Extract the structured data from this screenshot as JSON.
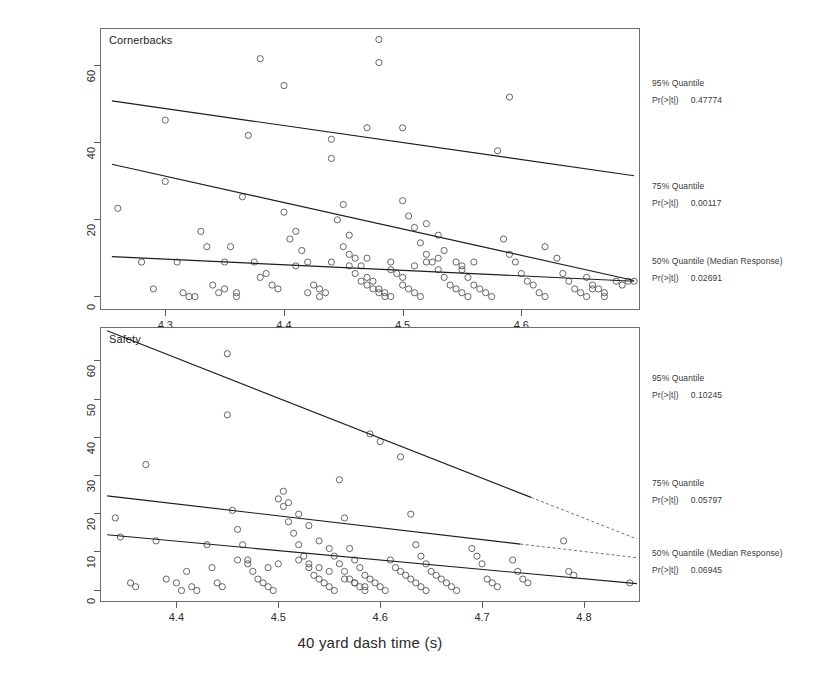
{
  "figure": {
    "xlabel": "40 yard dash time (s)",
    "ylabel": "Career Approximate Value"
  },
  "chart_data": [
    {
      "type": "scatter",
      "title": "Cornerbacks",
      "xlabel": "40 yard dash time (s)",
      "ylabel": "Career Approximate Value",
      "xlim": [
        4.245,
        4.7
      ],
      "ylim": [
        -3.5,
        70
      ],
      "xticks": [
        4.3,
        4.4,
        4.5,
        4.6
      ],
      "yticks": [
        0,
        20,
        40,
        60
      ],
      "grid": false,
      "points": [
        [
          4.26,
          23
        ],
        [
          4.28,
          9
        ],
        [
          4.29,
          2
        ],
        [
          4.3,
          30
        ],
        [
          4.3,
          46
        ],
        [
          4.31,
          9
        ],
        [
          4.315,
          1
        ],
        [
          4.32,
          0
        ],
        [
          4.325,
          0
        ],
        [
          4.33,
          17
        ],
        [
          4.335,
          13
        ],
        [
          4.34,
          3
        ],
        [
          4.345,
          1
        ],
        [
          4.35,
          9
        ],
        [
          4.355,
          13
        ],
        [
          4.36,
          0
        ],
        [
          4.365,
          26
        ],
        [
          4.37,
          42
        ],
        [
          4.375,
          9
        ],
        [
          4.38,
          5
        ],
        [
          4.385,
          6
        ],
        [
          4.39,
          3
        ],
        [
          4.395,
          2
        ],
        [
          4.4,
          55
        ],
        [
          4.4,
          22
        ],
        [
          4.405,
          15
        ],
        [
          4.41,
          17
        ],
        [
          4.415,
          12
        ],
        [
          4.42,
          9
        ],
        [
          4.425,
          3
        ],
        [
          4.43,
          2
        ],
        [
          4.435,
          1
        ],
        [
          4.44,
          41
        ],
        [
          4.445,
          20
        ],
        [
          4.45,
          13
        ],
        [
          4.455,
          11
        ],
        [
          4.46,
          6
        ],
        [
          4.465,
          4
        ],
        [
          4.47,
          3
        ],
        [
          4.475,
          2
        ],
        [
          4.48,
          1
        ],
        [
          4.485,
          0
        ],
        [
          4.49,
          7
        ],
        [
          4.495,
          6
        ],
        [
          4.5,
          5
        ],
        [
          4.5,
          3
        ],
        [
          4.505,
          2
        ],
        [
          4.51,
          1
        ],
        [
          4.515,
          0
        ],
        [
          4.44,
          36
        ],
        [
          4.45,
          24
        ],
        [
          4.455,
          16
        ],
        [
          4.46,
          10
        ],
        [
          4.465,
          8
        ],
        [
          4.47,
          5
        ],
        [
          4.475,
          4
        ],
        [
          4.48,
          2
        ],
        [
          4.485,
          1
        ],
        [
          4.49,
          0
        ],
        [
          4.5,
          25
        ],
        [
          4.505,
          21
        ],
        [
          4.51,
          18
        ],
        [
          4.515,
          14
        ],
        [
          4.52,
          11
        ],
        [
          4.525,
          9
        ],
        [
          4.53,
          7
        ],
        [
          4.535,
          5
        ],
        [
          4.54,
          3
        ],
        [
          4.545,
          2
        ],
        [
          4.55,
          1
        ],
        [
          4.555,
          0
        ],
        [
          4.48,
          67
        ],
        [
          4.48,
          61
        ],
        [
          4.47,
          44
        ],
        [
          4.5,
          44
        ],
        [
          4.52,
          19
        ],
        [
          4.53,
          16
        ],
        [
          4.535,
          12
        ],
        [
          4.545,
          9
        ],
        [
          4.55,
          7
        ],
        [
          4.555,
          5
        ],
        [
          4.56,
          3
        ],
        [
          4.565,
          2
        ],
        [
          4.57,
          1
        ],
        [
          4.575,
          0
        ],
        [
          4.58,
          38
        ],
        [
          4.585,
          15
        ],
        [
          4.59,
          11
        ],
        [
          4.595,
          9
        ],
        [
          4.6,
          6
        ],
        [
          4.605,
          4
        ],
        [
          4.61,
          3
        ],
        [
          4.615,
          1
        ],
        [
          4.62,
          0
        ],
        [
          4.59,
          52
        ],
        [
          4.62,
          13
        ],
        [
          4.63,
          10
        ],
        [
          4.635,
          6
        ],
        [
          4.64,
          4
        ],
        [
          4.645,
          2
        ],
        [
          4.65,
          1
        ],
        [
          4.655,
          0
        ],
        [
          4.66,
          3
        ],
        [
          4.665,
          2
        ],
        [
          4.67,
          1
        ],
        [
          4.68,
          4
        ],
        [
          4.685,
          3
        ],
        [
          4.69,
          4
        ],
        [
          4.695,
          4
        ],
        [
          4.655,
          5
        ],
        [
          4.66,
          2
        ],
        [
          4.67,
          0
        ],
        [
          4.38,
          62
        ],
        [
          4.42,
          1
        ],
        [
          4.43,
          0
        ],
        [
          4.35,
          2
        ],
        [
          4.36,
          1
        ],
        [
          4.41,
          8
        ],
        [
          4.44,
          9
        ],
        [
          4.455,
          8
        ],
        [
          4.47,
          10
        ],
        [
          4.49,
          9
        ],
        [
          4.51,
          8
        ],
        [
          4.52,
          9
        ],
        [
          4.53,
          10
        ],
        [
          4.55,
          8
        ],
        [
          4.56,
          9
        ]
      ],
      "fits": [
        {
          "name": "95% Quantile",
          "p_label": "Pr(>|t|)",
          "p_value": "0.47774",
          "x0": 4.255,
          "y0": 51.0,
          "x1": 4.695,
          "y1": 31.5,
          "solid_to": 1.0
        },
        {
          "name": "75% Quantile",
          "p_label": "Pr(>|t|)",
          "p_value": "0.00117",
          "x0": 4.255,
          "y0": 34.5,
          "x1": 4.695,
          "y1": 4.2,
          "solid_to": 1.0
        },
        {
          "name": "50% Quantile (Median Response)",
          "p_label": "Pr(>|t|)",
          "p_value": "0.02691",
          "x0": 4.255,
          "y0": 10.4,
          "x1": 4.695,
          "y1": 4.0,
          "solid_to": 1.0
        }
      ]
    },
    {
      "type": "scatter",
      "title": "Safety",
      "xlabel": "40 yard dash time (s)",
      "ylabel": "Career Approximate Value",
      "xlim": [
        4.325,
        4.855
      ],
      "ylim": [
        -3.0,
        69
      ],
      "xticks": [
        4.4,
        4.5,
        4.6,
        4.7,
        4.8
      ],
      "yticks": [
        0,
        10,
        20,
        30,
        40,
        50,
        60
      ],
      "grid": false,
      "points": [
        [
          4.34,
          19
        ],
        [
          4.345,
          14
        ],
        [
          4.355,
          2
        ],
        [
          4.36,
          1
        ],
        [
          4.37,
          33
        ],
        [
          4.38,
          13
        ],
        [
          4.39,
          3
        ],
        [
          4.4,
          2
        ],
        [
          4.405,
          0
        ],
        [
          4.41,
          5
        ],
        [
          4.415,
          1
        ],
        [
          4.42,
          0
        ],
        [
          4.43,
          12
        ],
        [
          4.435,
          6
        ],
        [
          4.44,
          2
        ],
        [
          4.445,
          1
        ],
        [
          4.45,
          62
        ],
        [
          4.45,
          46
        ],
        [
          4.455,
          21
        ],
        [
          4.46,
          16
        ],
        [
          4.465,
          12
        ],
        [
          4.47,
          8
        ],
        [
          4.475,
          5
        ],
        [
          4.48,
          3
        ],
        [
          4.485,
          2
        ],
        [
          4.49,
          1
        ],
        [
          4.495,
          0
        ],
        [
          4.5,
          24
        ],
        [
          4.505,
          22
        ],
        [
          4.51,
          18
        ],
        [
          4.515,
          15
        ],
        [
          4.52,
          12
        ],
        [
          4.525,
          9
        ],
        [
          4.53,
          6
        ],
        [
          4.535,
          4
        ],
        [
          4.54,
          3
        ],
        [
          4.545,
          2
        ],
        [
          4.55,
          1
        ],
        [
          4.555,
          0
        ],
        [
          4.505,
          26
        ],
        [
          4.51,
          23
        ],
        [
          4.52,
          20
        ],
        [
          4.53,
          17
        ],
        [
          4.54,
          13
        ],
        [
          4.55,
          11
        ],
        [
          4.555,
          9
        ],
        [
          4.56,
          7
        ],
        [
          4.565,
          5
        ],
        [
          4.57,
          3
        ],
        [
          4.575,
          2
        ],
        [
          4.58,
          1
        ],
        [
          4.585,
          0
        ],
        [
          4.56,
          29
        ],
        [
          4.565,
          19
        ],
        [
          4.57,
          11
        ],
        [
          4.575,
          8
        ],
        [
          4.58,
          6
        ],
        [
          4.585,
          4
        ],
        [
          4.59,
          3
        ],
        [
          4.595,
          2
        ],
        [
          4.6,
          1
        ],
        [
          4.605,
          0
        ],
        [
          4.59,
          41
        ],
        [
          4.6,
          39
        ],
        [
          4.61,
          8
        ],
        [
          4.615,
          6
        ],
        [
          4.62,
          5
        ],
        [
          4.625,
          4
        ],
        [
          4.63,
          3
        ],
        [
          4.635,
          2
        ],
        [
          4.64,
          1
        ],
        [
          4.645,
          0
        ],
        [
          4.62,
          35
        ],
        [
          4.63,
          20
        ],
        [
          4.635,
          12
        ],
        [
          4.64,
          9
        ],
        [
          4.645,
          7
        ],
        [
          4.65,
          5
        ],
        [
          4.655,
          4
        ],
        [
          4.66,
          3
        ],
        [
          4.665,
          2
        ],
        [
          4.67,
          1
        ],
        [
          4.675,
          0
        ],
        [
          4.69,
          11
        ],
        [
          4.695,
          9
        ],
        [
          4.7,
          7
        ],
        [
          4.705,
          3
        ],
        [
          4.71,
          2
        ],
        [
          4.715,
          1
        ],
        [
          4.73,
          8
        ],
        [
          4.735,
          5
        ],
        [
          4.74,
          3
        ],
        [
          4.745,
          2
        ],
        [
          4.78,
          13
        ],
        [
          4.785,
          5
        ],
        [
          4.79,
          4
        ],
        [
          4.845,
          2
        ],
        [
          4.46,
          8
        ],
        [
          4.47,
          7
        ],
        [
          4.49,
          6
        ],
        [
          4.5,
          7
        ],
        [
          4.52,
          8
        ],
        [
          4.53,
          7
        ],
        [
          4.54,
          6
        ],
        [
          4.55,
          5
        ],
        [
          4.565,
          3
        ],
        [
          4.575,
          2
        ],
        [
          4.585,
          1
        ]
      ],
      "fits": [
        {
          "name": "95% Quantile",
          "p_label": "Pr(>|t|)",
          "p_value": "0.10245",
          "x0": 4.332,
          "y0": 68.0,
          "x1": 4.852,
          "y1": 13.5,
          "solid_to": 0.8
        },
        {
          "name": "75% Quantile",
          "p_label": "Pr(>|t|)",
          "p_value": "0.05797",
          "x0": 4.332,
          "y0": 24.8,
          "x1": 4.852,
          "y1": 8.6,
          "solid_to": 0.78
        },
        {
          "name": "50% Quantile (Median Response)",
          "p_label": "Pr(>|t|)",
          "p_value": "0.06945",
          "x0": 4.332,
          "y0": 14.6,
          "x1": 4.852,
          "y1": 1.8,
          "solid_to": 1.0
        }
      ]
    }
  ],
  "annotations": {
    "top": [
      {
        "title": "95% Quantile",
        "p_label": "Pr(>|t|)",
        "p_value": "0.47774",
        "top": 78
      },
      {
        "title": "75% Quantile",
        "p_label": "Pr(>|t|)",
        "p_value": "0.00117",
        "top": 181
      },
      {
        "title": "50% Quantile (Median Response)",
        "p_label": "Pr(>|t|)",
        "p_value": "0.02691",
        "top": 256
      }
    ],
    "bottom": [
      {
        "title": "95% Quantile",
        "p_label": "Pr(>|t|)",
        "p_value": "0.10245",
        "top": 373
      },
      {
        "title": "75% Quantile",
        "p_label": "Pr(>|t|)",
        "p_value": "0.05797",
        "top": 478
      },
      {
        "title": "50% Quantile (Median Response)",
        "p_label": "Pr(>|t|)",
        "p_value": "0.06945",
        "top": 548
      }
    ]
  }
}
